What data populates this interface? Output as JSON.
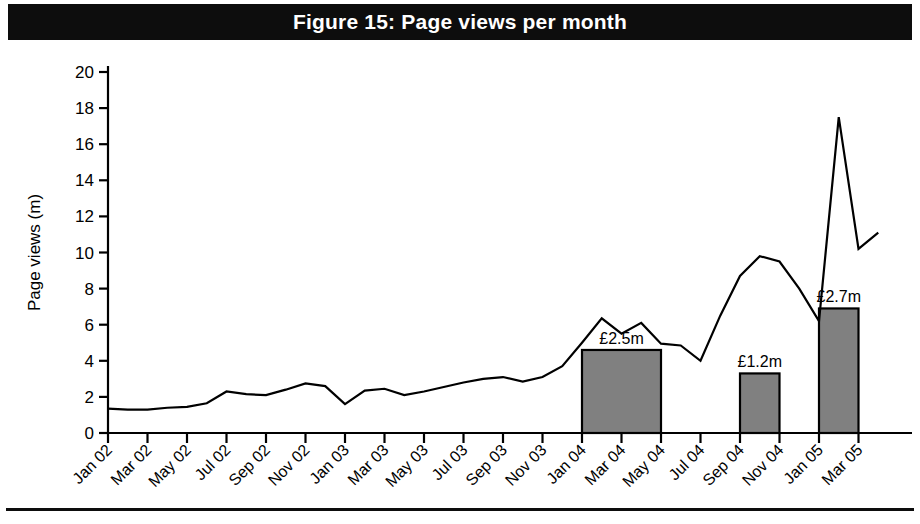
{
  "figure": {
    "title": "Figure 15: Page views per month",
    "title_background": "#0d0d0d",
    "title_color": "#ffffff"
  },
  "chart_data": {
    "type": "line",
    "title": "Figure 15: Page views per month",
    "xlabel": "",
    "ylabel": "Page views (m)",
    "ylim": [
      0,
      20
    ],
    "ytick_step": 2,
    "ytick_labels": [
      "0",
      "2",
      "4",
      "6",
      "8",
      "10",
      "12",
      "14",
      "16",
      "18",
      "20"
    ],
    "grid": false,
    "legend": "none",
    "x": [
      "Jan 02",
      "Feb 02",
      "Mar 02",
      "Apr 02",
      "May 02",
      "Jun 02",
      "Jul 02",
      "Aug 02",
      "Sep 02",
      "Oct 02",
      "Nov 02",
      "Dec 02",
      "Jan 03",
      "Feb 03",
      "Mar 03",
      "Apr 03",
      "May 03",
      "Jun 03",
      "Jul 03",
      "Aug 03",
      "Sep 03",
      "Oct 03",
      "Nov 03",
      "Dec 03",
      "Jan 04",
      "Feb 04",
      "Mar 04",
      "Apr 04",
      "May 04",
      "Jun 04",
      "Jul 04",
      "Aug 04",
      "Sep 04",
      "Oct 04",
      "Nov 04",
      "Dec 04",
      "Jan 05",
      "Feb 05",
      "Mar 05"
    ],
    "xtick_labels": [
      "Jan 02",
      "Mar 02",
      "May 02",
      "Jul 02",
      "Sep 02",
      "Nov 02",
      "Jan 03",
      "Mar 03",
      "May 03",
      "Jul 03",
      "Sep 03",
      "Nov 03",
      "Jan 04",
      "Mar 04",
      "May 04",
      "Jul 04",
      "Sep 04",
      "Nov 04",
      "Jan 05",
      "Mar 05"
    ],
    "series": [
      {
        "name": "Page views (m)",
        "type": "line",
        "color": "#000000",
        "values": [
          1.35,
          1.3,
          1.3,
          1.4,
          1.45,
          1.65,
          2.3,
          2.15,
          2.1,
          2.4,
          2.75,
          2.6,
          1.6,
          2.35,
          2.45,
          2.1,
          2.3,
          2.55,
          2.8,
          3.0,
          3.1,
          2.85,
          3.1,
          3.7,
          5.0,
          6.35,
          5.5,
          6.1,
          4.95,
          4.85,
          4.0,
          6.5,
          8.7,
          9.8,
          9.5,
          8.0,
          6.2,
          17.5,
          10.2
        ],
        "final_extension": 11.1
      },
      {
        "name": "Advertising revenue bars",
        "type": "bar",
        "color": "#808080",
        "edge_color": "#000000",
        "bars": [
          {
            "label": "£2.5m",
            "start": "Jan 04",
            "end": "May 04",
            "height": 4.6
          },
          {
            "label": "£1.2m",
            "start": "Sep 04",
            "end": "Nov 04",
            "height": 3.3
          },
          {
            "label": "£2.7m",
            "start": "Jan 05",
            "end": "Mar 05",
            "height": 6.9
          }
        ]
      }
    ]
  }
}
